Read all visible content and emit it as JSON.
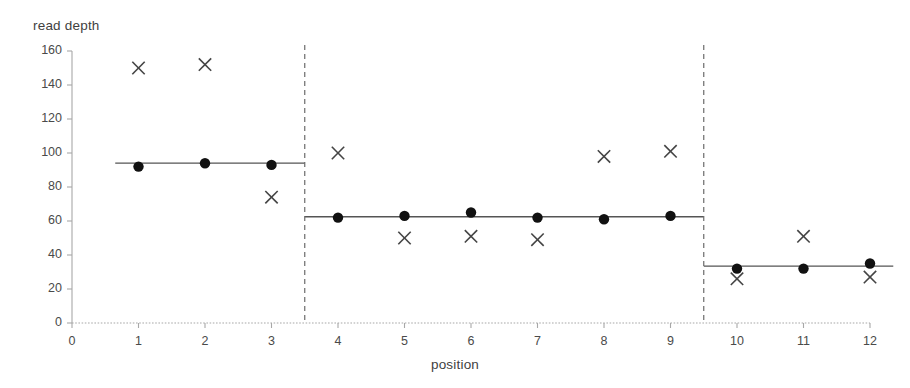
{
  "chart_data": {
    "type": "scatter",
    "title": "",
    "xlabel": "position",
    "ylabel": "read depth",
    "xlim": [
      0,
      12
    ],
    "ylim": [
      0,
      160
    ],
    "x_ticks": [
      0,
      1,
      2,
      3,
      4,
      5,
      6,
      7,
      8,
      9,
      10,
      11,
      12
    ],
    "y_ticks": [
      0,
      20,
      40,
      60,
      80,
      100,
      120,
      140,
      160
    ],
    "grid": false,
    "legend": "none",
    "x": [
      1,
      2,
      3,
      4,
      5,
      6,
      7,
      8,
      9,
      10,
      11,
      12
    ],
    "series": [
      {
        "name": "observed read depth",
        "marker": "circle",
        "color": "#111111",
        "values": [
          92,
          94,
          93,
          62,
          63,
          65,
          62,
          61,
          63,
          32,
          32,
          35
        ]
      },
      {
        "name": "alternative read depth",
        "marker": "cross",
        "color": "#444444",
        "values": [
          150,
          152,
          74,
          100,
          50,
          51,
          49,
          98,
          101,
          26,
          51,
          27
        ]
      }
    ],
    "segments": [
      {
        "name": "segment-1",
        "x_start": 0.65,
        "x_end": 3.5,
        "level": 94
      },
      {
        "name": "segment-2",
        "x_start": 3.5,
        "x_end": 9.5,
        "level": 62.5
      },
      {
        "name": "segment-3",
        "x_start": 9.5,
        "x_end": 12.35,
        "level": 33.5
      }
    ],
    "breakpoints": [
      3.5,
      9.5
    ],
    "segment_line_color": "#555555",
    "breakpoint_line_color": "#6b6b6b",
    "axis_color": "#a8a8a8"
  }
}
